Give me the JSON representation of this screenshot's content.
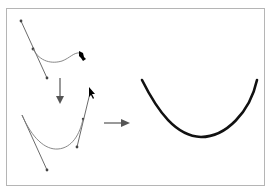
{
  "diagram": {
    "title": "",
    "colors": {
      "frame": "#b5b5b5",
      "handle_line": "#5a5a5a",
      "anchor": "#444444",
      "path_preview": "#7a7a7a",
      "arrow": "#555555",
      "final_curve": "#111111",
      "cursor": "#000000"
    },
    "steps": [
      {
        "id": "step1",
        "label": "",
        "icon": "pen-drag-cursor-icon"
      },
      {
        "id": "step2",
        "label": "",
        "icon": "arrow-cursor-icon"
      },
      {
        "id": "result",
        "label": ""
      }
    ],
    "arrows": [
      {
        "id": "down-arrow",
        "direction": "down"
      },
      {
        "id": "right-arrow",
        "direction": "right"
      }
    ]
  }
}
